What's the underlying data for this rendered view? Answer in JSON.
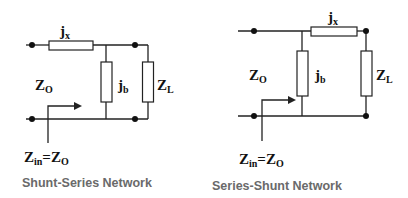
{
  "diagrams": [
    {
      "caption": "Shunt-Series Network",
      "labels": {
        "series": {
          "main": "j",
          "sub": "x"
        },
        "shunt": {
          "main": "j",
          "sub": "b"
        },
        "load": {
          "main": "Z",
          "sub": "L"
        },
        "source": {
          "main": "Z",
          "sub": "O"
        },
        "input_eq": {
          "main1": "Z",
          "sub1": "in",
          "eq": "=Z",
          "sub2": "O"
        }
      }
    },
    {
      "caption": "Series-Shunt Network",
      "labels": {
        "series": {
          "main": "j",
          "sub": "x"
        },
        "shunt": {
          "main": "j",
          "sub": "b"
        },
        "load": {
          "main": "Z",
          "sub": "L"
        },
        "source": {
          "main": "Z",
          "sub": "O"
        },
        "input_eq": {
          "main1": "Z",
          "sub1": "in",
          "eq": "=Z",
          "sub2": "O"
        }
      }
    }
  ],
  "colors": {
    "line": "#222222",
    "caption": "#6a6a6a",
    "background": "#ffffff"
  }
}
